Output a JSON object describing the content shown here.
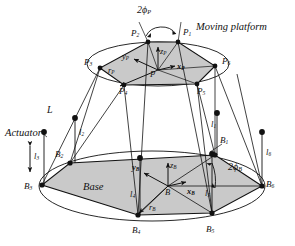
{
  "figure": {
    "colors": {
      "line": "#111111",
      "fill": "#c9c9c9",
      "background": "#ffffff"
    }
  },
  "annotations": {
    "moving_platform": "Moving platform",
    "base": "Base",
    "actuator": "Actuator",
    "leg_length": "L",
    "platform_angle": "2ϕ",
    "platform_angle_sub": "P",
    "base_angle": "2ϕ",
    "base_angle_sub": "B"
  },
  "platform": {
    "origin_label": "P",
    "radius_vector": "r",
    "radius_vector_sub": "P",
    "axes": [
      {
        "name": "x-axis",
        "label": "x",
        "sub": "P"
      },
      {
        "name": "y-axis",
        "label": "y",
        "sub": "P"
      },
      {
        "name": "z-axis",
        "label": "z",
        "sub": "P"
      }
    ],
    "vertices": [
      {
        "label": "P",
        "sub": "1"
      },
      {
        "label": "P",
        "sub": "2"
      },
      {
        "label": "P",
        "sub": "3"
      },
      {
        "label": "P",
        "sub": "4"
      },
      {
        "label": "P",
        "sub": "5"
      },
      {
        "label": "P",
        "sub": "6"
      }
    ]
  },
  "base": {
    "origin_label": "B",
    "radius_vector": "r",
    "radius_vector_sub": "B",
    "axes": [
      {
        "name": "x-axis",
        "label": "x",
        "sub": "B"
      },
      {
        "name": "y-axis",
        "label": "y",
        "sub": "B"
      },
      {
        "name": "z-axis",
        "label": "z",
        "sub": "B"
      }
    ],
    "vertices": [
      {
        "label": "B",
        "sub": "1"
      },
      {
        "label": "B",
        "sub": "2"
      },
      {
        "label": "B",
        "sub": "3"
      },
      {
        "label": "B",
        "sub": "4"
      },
      {
        "label": "B",
        "sub": "5"
      },
      {
        "label": "B",
        "sub": "6"
      }
    ]
  },
  "actuators": [
    {
      "label": "l",
      "sub": "1"
    },
    {
      "label": "l",
      "sub": "2"
    },
    {
      "label": "l",
      "sub": "3"
    },
    {
      "label": "l",
      "sub": "4"
    },
    {
      "label": "l",
      "sub": "5"
    },
    {
      "label": "l",
      "sub": "6"
    }
  ]
}
